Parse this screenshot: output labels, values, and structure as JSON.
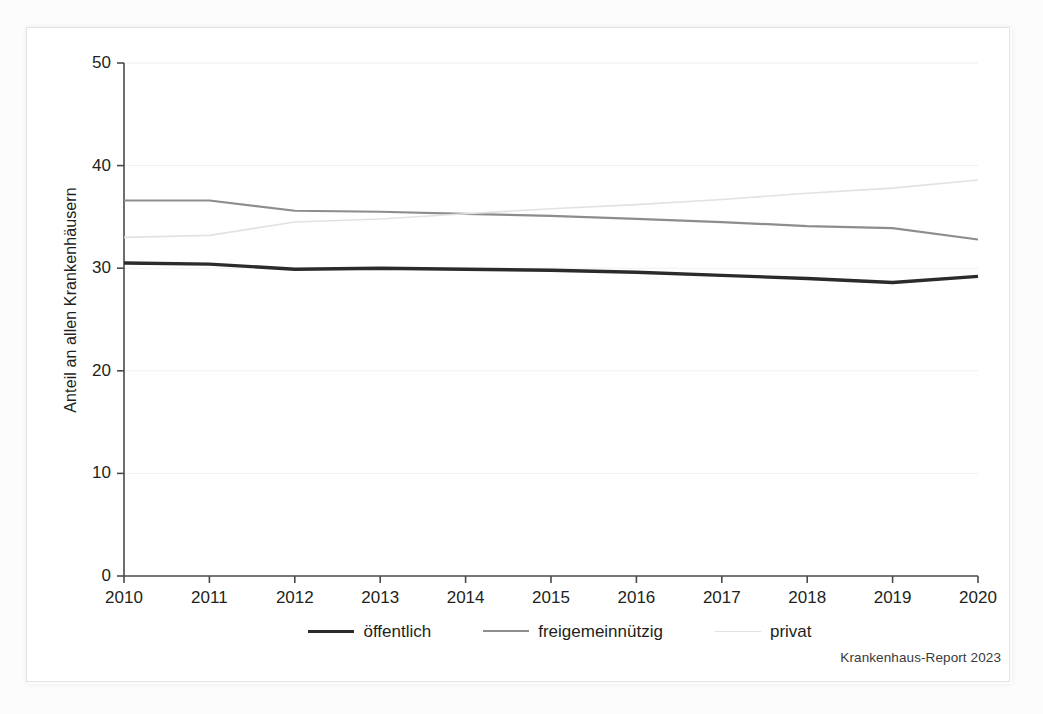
{
  "figure": {
    "source_caption": "Krankenhaus-Report 2023"
  },
  "chart_data": {
    "type": "line",
    "title": "",
    "subtitle": "",
    "xlabel": "",
    "ylabel": "Anteil an allen Krankenhäusern",
    "categories": [
      "2010",
      "2011",
      "2012",
      "2013",
      "2014",
      "2015",
      "2016",
      "2017",
      "2018",
      "2019",
      "2020"
    ],
    "x": [
      2010,
      2011,
      2012,
      2013,
      2014,
      2015,
      2016,
      2017,
      2018,
      2019,
      2020
    ],
    "xlim": [
      2010,
      2020
    ],
    "ylim": [
      0,
      50
    ],
    "yticks": [
      0,
      10,
      20,
      30,
      40,
      50
    ],
    "ytick_labels": [
      "0",
      "10",
      "20",
      "30",
      "40",
      "50"
    ],
    "xticks": [
      2010,
      2011,
      2012,
      2013,
      2014,
      2015,
      2016,
      2017,
      2018,
      2019,
      2020
    ],
    "grid": "horizontal",
    "legend_position": "bottom",
    "series": [
      {
        "name": "öffentlich",
        "color": "#2b2b2b",
        "width": 3.4,
        "values": [
          30.5,
          30.4,
          29.9,
          30.0,
          29.9,
          29.8,
          29.6,
          29.3,
          29.0,
          28.6,
          29.2
        ]
      },
      {
        "name": "freigemeinnützig",
        "color": "#8d8d8d",
        "width": 2.2,
        "values": [
          36.6,
          36.6,
          35.6,
          35.5,
          35.3,
          35.1,
          34.8,
          34.5,
          34.1,
          33.9,
          32.8
        ]
      },
      {
        "name": "privat",
        "color": "#e2e2e2",
        "width": 1.6,
        "values": [
          33.0,
          33.2,
          34.5,
          34.8,
          35.3,
          35.8,
          36.2,
          36.7,
          37.3,
          37.8,
          38.6
        ]
      }
    ]
  },
  "legend": {
    "entries": [
      {
        "label": "öffentlich"
      },
      {
        "label": "freigemeinnützig"
      },
      {
        "label": "privat"
      }
    ]
  }
}
